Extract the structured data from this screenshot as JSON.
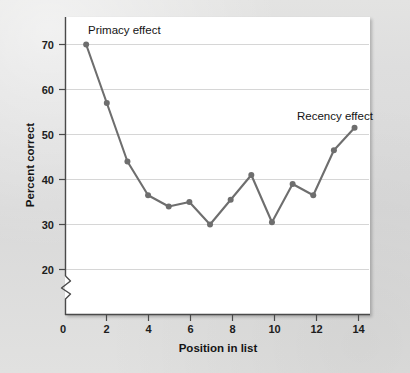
{
  "chart_data": {
    "type": "line",
    "title": "",
    "xlabel": "Position in list",
    "ylabel": "Percent correct",
    "x": [
      1,
      2,
      3,
      4,
      5,
      6,
      7,
      8,
      9,
      10,
      11,
      12,
      13,
      14
    ],
    "values": [
      70,
      57,
      44,
      36.5,
      34,
      35,
      30,
      35.5,
      41,
      30.5,
      39,
      36.5,
      46.5,
      51.5
    ],
    "series": [
      {
        "name": "Percent correct",
        "values": [
          70,
          57,
          44,
          36.5,
          34,
          35,
          30,
          35.5,
          41,
          30.5,
          39,
          36.5,
          46.5,
          51.5
        ]
      }
    ],
    "xlim": [
      0,
      14.7
    ],
    "ylim": [
      20,
      73
    ],
    "xticks": [
      0,
      2,
      4,
      6,
      8,
      10,
      12,
      14
    ],
    "xticklabels": [
      "0",
      "2",
      "4",
      "6",
      "8",
      "10",
      "12",
      "14"
    ],
    "yticks": [
      20,
      30,
      40,
      50,
      60,
      70
    ],
    "yticklabels": [
      "20",
      "30",
      "40",
      "50",
      "60",
      "70"
    ],
    "grid": "horizontal",
    "legend": "none",
    "axis_break": {
      "axis": "y",
      "between": [
        0,
        20
      ],
      "style": "zigzag"
    },
    "annotations": [
      {
        "text": "Primacy effect",
        "x": 1.4,
        "y": 73.5,
        "anchor": "start"
      },
      {
        "text": "Recency effect",
        "x": 11.5,
        "y": 55.5,
        "anchor": "start"
      }
    ],
    "colors": {
      "line": "#6e6e6e",
      "marker": "#6e6e6e",
      "grid": "#d6d6d6",
      "axis": "#4a4a4a",
      "panel_background": "#ffffff",
      "page_background": "#dcdcdc",
      "text": "#141414"
    }
  },
  "axes": {
    "y_title": "Percent correct",
    "x_title": "Position in list",
    "y_tick_labels": [
      "70",
      "60",
      "50",
      "40",
      "30",
      "20"
    ],
    "x_tick_labels": [
      "0",
      "2",
      "4",
      "6",
      "8",
      "10",
      "12",
      "14"
    ],
    "origin_label": "0"
  },
  "annotations": {
    "primacy": "Primacy effect",
    "recency": "Recency effect"
  }
}
